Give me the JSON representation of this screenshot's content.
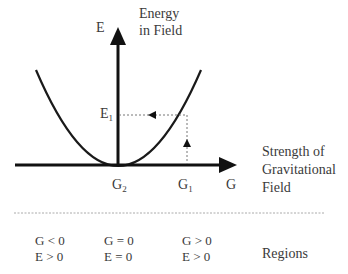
{
  "diagram": {
    "y_axis": {
      "symbol": "E",
      "title_line1": "Energy",
      "title_line2": "in Field"
    },
    "x_axis": {
      "symbol": "G",
      "title_line1": "Strength of",
      "title_line2": "Gravitational",
      "title_line3": "Field"
    },
    "markers": {
      "e1": {
        "base": "E",
        "sub": "1"
      },
      "g1": {
        "base": "G",
        "sub": "1"
      },
      "g2": {
        "base": "G",
        "sub": "2"
      }
    },
    "regions": {
      "label": "Regions",
      "items": [
        {
          "line1": "G < 0",
          "line2": "E > 0"
        },
        {
          "line1": "G = 0",
          "line2": "E = 0"
        },
        {
          "line1": "G > 0",
          "line2": "E > 0"
        }
      ]
    },
    "colors": {
      "curve": "#1a1a1a",
      "axis": "#111111",
      "dashed": "#777777",
      "text": "#3a3a3a"
    }
  }
}
